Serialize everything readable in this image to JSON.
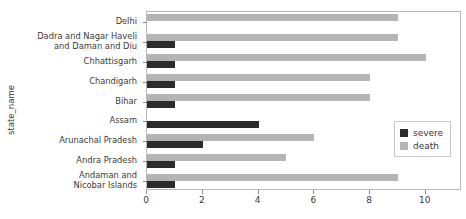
{
  "chart_data": {
    "type": "bar",
    "orientation": "horizontal",
    "title": "",
    "xlabel": "",
    "ylabel": "state_name",
    "xlim": [
      0,
      11.3
    ],
    "ylim": null,
    "grid": false,
    "legend_position": "center-right",
    "xticks": [
      "0",
      "2",
      "4",
      "6",
      "8",
      "10"
    ],
    "xtick_values": [
      0,
      2,
      4,
      6,
      8,
      10
    ],
    "categories": [
      "Delhi",
      "Dadra and Nagar Haveli\nand Daman and Diu",
      "Chhattisgarh",
      "Chandigarh",
      "Bihar",
      "Assam",
      "Arunachal Pradesh",
      "Andra Pradesh",
      "Andaman and\nNicobar Islands"
    ],
    "series": [
      {
        "name": "severe",
        "color": "#2c2c2c",
        "values": [
          0,
          1,
          1,
          1,
          1,
          4,
          2,
          1,
          1
        ]
      },
      {
        "name": "death",
        "color": "#b4b4b4",
        "values": [
          9,
          9,
          10,
          8,
          8,
          0,
          6,
          5,
          9
        ]
      }
    ]
  },
  "legend": {
    "items": [
      {
        "label": "severe",
        "color": "#2c2c2c"
      },
      {
        "label": "death",
        "color": "#b4b4b4"
      }
    ]
  }
}
